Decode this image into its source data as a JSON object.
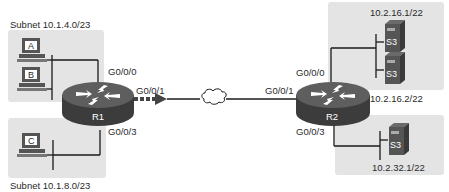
{
  "diagram": {
    "type": "network-topology",
    "colors": {
      "zone_fill": "#e4e4e4",
      "router_top": "#5a5a5a",
      "router_side": "#3c3c3c",
      "link": "#1a1a1a",
      "serial_link": "#444444"
    },
    "subnets": {
      "left_top": {
        "label": "Subnet 10.1.4.0/23"
      },
      "left_bottom": {
        "label": "Subnet 10.1.8.0/23"
      }
    },
    "hosts": [
      {
        "id": "A",
        "label": "A"
      },
      {
        "id": "B",
        "label": "B"
      },
      {
        "id": "C",
        "label": "C"
      }
    ],
    "routers": [
      {
        "id": "R1",
        "label": "R1",
        "interfaces": {
          "g000": "G0/0/0",
          "g001": "G0/0/1",
          "g003": "G0/0/3"
        }
      },
      {
        "id": "R2",
        "label": "R2",
        "interfaces": {
          "g000": "G0/0/0",
          "g001": "G0/0/1",
          "g003": "G0/0/3"
        }
      }
    ],
    "servers": [
      {
        "label": "S3",
        "ip": "10.2.16.1/22"
      },
      {
        "label": "S3",
        "ip": "10.2.16.2/22"
      },
      {
        "label": "S3",
        "ip": "10.2.32.1/22"
      }
    ],
    "wan": {
      "icon": "cloud-icon"
    }
  }
}
